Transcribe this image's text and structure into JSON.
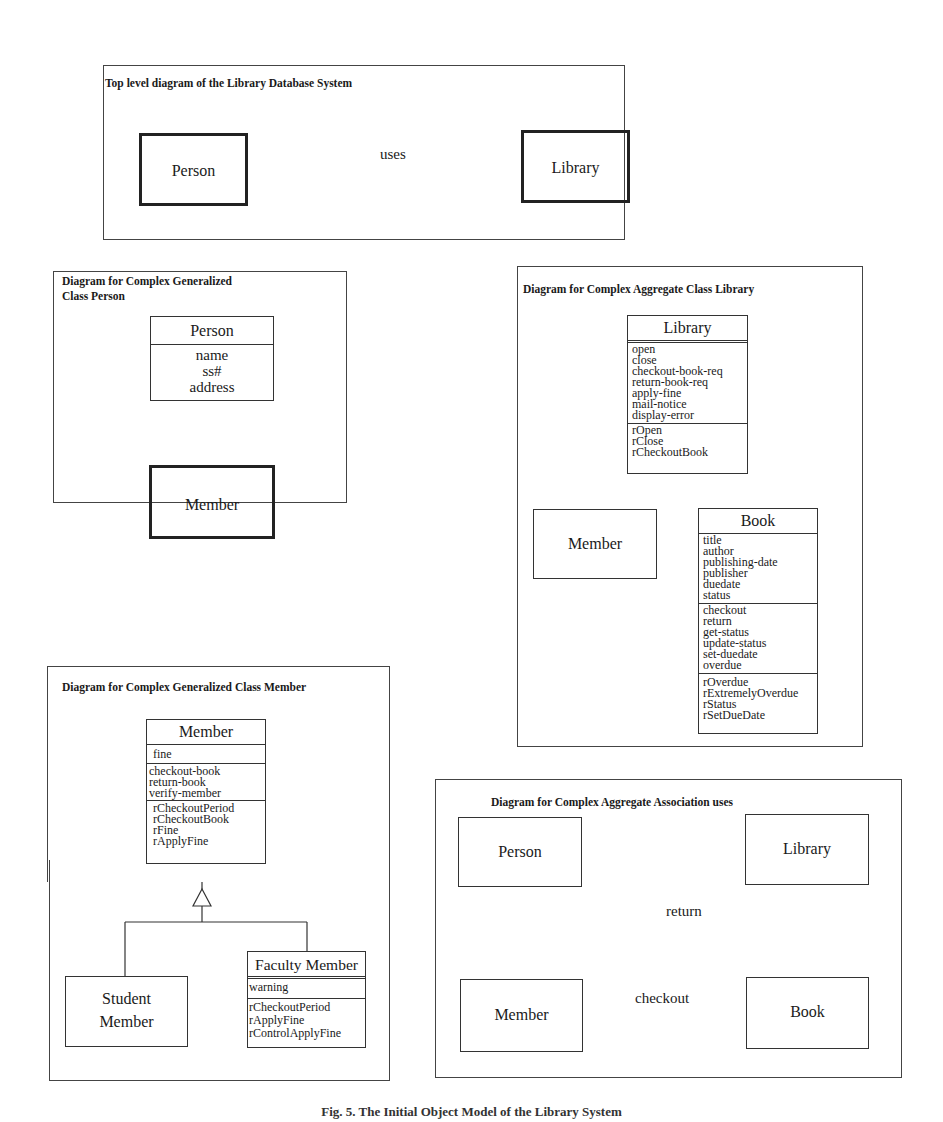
{
  "top_diagram": {
    "title": "Top level diagram of the Library Database System",
    "person": {
      "label": "Person",
      "badge": "G",
      "badge_icon": "generalization-triangle-icon"
    },
    "library": {
      "label": "Library",
      "badge": "A",
      "badge_icon": "aggregate-diamond-icon"
    },
    "association": {
      "label": "uses",
      "badge": "A",
      "badge_icon": "aggregate-diamond-icon"
    }
  },
  "person_diagram": {
    "title": "Diagram for  Complex Generalized\nClass Person",
    "person_class": {
      "name": "Person",
      "attributes": [
        "name",
        "ss#",
        "address"
      ]
    },
    "member": {
      "label": "Member",
      "badge": "G",
      "badge_icon": "generalization-triangle-icon"
    },
    "relation": "generalization"
  },
  "library_diagram": {
    "title": "Diagram for  Complex Aggregate Class Library",
    "library_class": {
      "name": "Library",
      "operations": [
        "open",
        "close",
        "checkout-book-req",
        "return-book-req",
        "apply-fine",
        "mail-notice",
        "display-error"
      ],
      "rules": [
        "rOpen",
        "rClose",
        "rCheckoutBook"
      ]
    },
    "member": {
      "label": "Member"
    },
    "book_class": {
      "name": "Book",
      "attributes": [
        "title",
        "author",
        "publishing-date",
        "publisher",
        "duedate",
        "status"
      ],
      "operations": [
        "checkout",
        "return",
        "get-status",
        "update-status",
        "set-duedate",
        "overdue"
      ],
      "rules": [
        "rOverdue",
        "rExtremelyOverdue",
        "rStatus",
        "rSetDueDate"
      ]
    },
    "relation": "aggregation"
  },
  "member_diagram": {
    "title": "Diagram for  Complex Generalized Class Member",
    "member_class": {
      "name": "Member",
      "attributes": [
        "fine"
      ],
      "operations": [
        "checkout-book",
        "return-book",
        "verify-member"
      ],
      "rules": [
        "rCheckoutPeriod",
        "rCheckoutBook",
        "rFine",
        "rApplyFine"
      ]
    },
    "student_member": {
      "label_line1": "Student",
      "label_line2": "Member"
    },
    "faculty_member": {
      "name": "Faculty Member",
      "attributes": [
        "warning"
      ],
      "rules": [
        "rCheckoutPeriod",
        "rApplyFine",
        "rControlApplyFine"
      ]
    },
    "relation": "generalization"
  },
  "association_diagram": {
    "title": "Diagram for  Complex Aggregate Association uses",
    "person": {
      "label": "Person"
    },
    "library": {
      "label": "Library"
    },
    "member": {
      "label": "Member"
    },
    "book": {
      "label": "Book"
    },
    "links": {
      "return": "return",
      "checkout": "checkout"
    }
  },
  "caption": "Fig. 5.  The Initial Object Model of the Library System"
}
